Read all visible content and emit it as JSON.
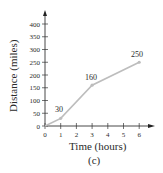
{
  "chart_data": {
    "type": "line",
    "title": "",
    "caption": "(c)",
    "xlabel": "Time (hours)",
    "ylabel": "Distance (miles)",
    "x": [
      0,
      1,
      3,
      6
    ],
    "series": [
      {
        "name": "Distance",
        "values": [
          0,
          30,
          160,
          250
        ],
        "color": "#bdbdbd"
      }
    ],
    "data_labels": [
      {
        "x": 1,
        "y": 30,
        "text": "30"
      },
      {
        "x": 3,
        "y": 160,
        "text": "160"
      },
      {
        "x": 6,
        "y": 250,
        "text": "250"
      }
    ],
    "xticks": [
      0,
      1,
      2,
      3,
      4,
      5,
      6
    ],
    "yticks": [
      0,
      50,
      100,
      150,
      200,
      250,
      300,
      350,
      400
    ],
    "xlim": [
      0,
      6.8
    ],
    "ylim": [
      0,
      440
    ],
    "grid": false,
    "legend": "none"
  },
  "labels": {
    "xlabel": "Time (hours)",
    "ylabel": "Distance (miles)",
    "caption": "(c)",
    "point_30": "30",
    "point_160": "160",
    "point_250": "250"
  }
}
